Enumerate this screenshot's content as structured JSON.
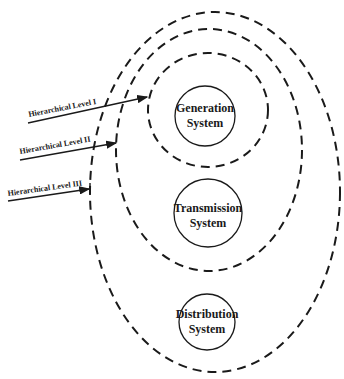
{
  "diagram": {
    "levels": [
      {
        "label": "Hierarchical Level I"
      },
      {
        "label": "Hierarchical Level II"
      },
      {
        "label": "Hierarchical Level III"
      }
    ],
    "systems": [
      {
        "line1": "Generation",
        "line2": "System"
      },
      {
        "line1": "Transmission",
        "line2": "System"
      },
      {
        "line1": "Distribution",
        "line2": "System"
      }
    ],
    "colors": {
      "stroke": "#1a1a1a",
      "background": "#ffffff"
    }
  }
}
